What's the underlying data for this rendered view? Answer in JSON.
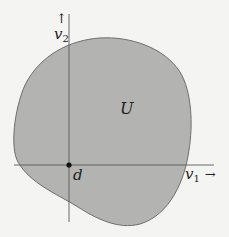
{
  "diagram": {
    "region_label": "U",
    "point_label": "d",
    "x_axis": {
      "var": "v",
      "sub": "1",
      "arrow": "→"
    },
    "y_axis": {
      "var": "v",
      "sub": "2",
      "arrow": "↑"
    },
    "colors": {
      "background": "#f4f4f2",
      "region_fill": "#b3b3b1",
      "region_stroke": "#6e6e6e",
      "axis": "#5a5a5a",
      "point": "#111111"
    }
  }
}
